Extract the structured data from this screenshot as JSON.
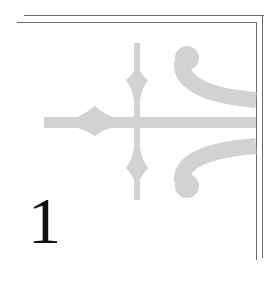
{
  "page": {
    "chapter_number": "1",
    "ornament": "fleur-de-lis-corner-flourish",
    "colors": {
      "background": "#ffffff",
      "border_rule": "#6d6d6d",
      "ornament_fill": "#d2d2d2",
      "chapter_number": "#111111"
    }
  }
}
